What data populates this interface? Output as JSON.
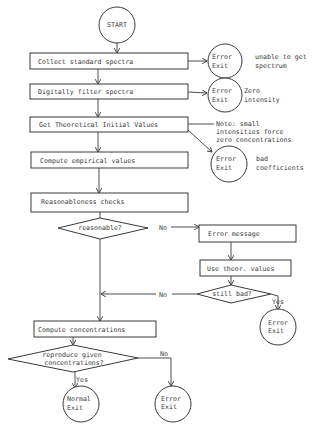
{
  "flowchart": {
    "start": {
      "label": "START"
    },
    "steps": [
      {
        "id": "collect",
        "label": "Collect standard spectra"
      },
      {
        "id": "filter",
        "label": "Digitally filter spectra"
      },
      {
        "id": "theoretical",
        "label": "Get Theoretical Initial Values"
      },
      {
        "id": "empirical",
        "label": "Compute empirical values"
      },
      {
        "id": "reasonableness",
        "label": "Reasonableness checks"
      },
      {
        "id": "error_message",
        "label": "Error message"
      },
      {
        "id": "use_theor",
        "label": "Use theor. values"
      },
      {
        "id": "compute_conc",
        "label": "Compute concentrations"
      }
    ],
    "decisions": [
      {
        "id": "reasonable",
        "label": "reasonable?",
        "no_label": "No"
      },
      {
        "id": "still_bad",
        "label": "still bad?",
        "no_label": "No",
        "yes_label": "Yes"
      },
      {
        "id": "reproduce",
        "line1": "reproduce given",
        "line2": "concentrations?",
        "yes_label": "Yes",
        "no_label": "No"
      }
    ],
    "exits": [
      {
        "id": "err1",
        "line1": "Error",
        "line2": "Exit",
        "note1": "unable to get",
        "note2": "spectrum"
      },
      {
        "id": "err2",
        "line1": "Error",
        "line2": "Exit",
        "note1": "Zero",
        "note2": "intensity"
      },
      {
        "id": "err3",
        "line1": "Error",
        "line2": "Exit",
        "note1": "bad",
        "note2": "coefficients"
      },
      {
        "id": "err4",
        "line1": "Error",
        "line2": "Exit"
      },
      {
        "id": "normal",
        "line1": "Normal",
        "line2": "Exit"
      },
      {
        "id": "err5",
        "line1": "Error",
        "line2": "Exit"
      }
    ],
    "note": {
      "line1": "Note: small",
      "line2": "intensities force",
      "line3": "zero concentrations"
    }
  }
}
